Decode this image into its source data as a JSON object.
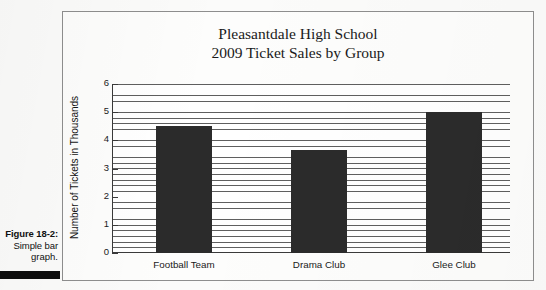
{
  "caption": {
    "figure_number": "Figure 18-2:",
    "text_line1": "Simple bar",
    "text_line2": "graph."
  },
  "chart_data": {
    "type": "bar",
    "title": "Pleasantdale High School 2009 Ticket Sales by Group",
    "title_line1": "Pleasantdale High School",
    "title_line2": "2009 Ticket Sales by Group",
    "categories": [
      "Football Team",
      "Drama Club",
      "Glee Club"
    ],
    "values": [
      4.5,
      3.65,
      5.0
    ],
    "xlabel": "",
    "ylabel": "Number of Tickets in Thousands",
    "ylim": [
      0,
      6
    ],
    "ytick_labels": [
      "0",
      "1",
      "2",
      "3",
      "4",
      "5",
      "6"
    ],
    "ytick_values": [
      0,
      1,
      2,
      3,
      4,
      5,
      6
    ],
    "grid": "horizontal-minor",
    "legend": "none",
    "bar_color": "#2b2b2b",
    "gridline_color": "#5f5f5f",
    "axis_color": "#3a3a3a"
  }
}
